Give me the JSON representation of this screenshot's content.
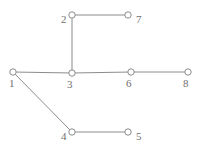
{
  "figure": {
    "name": "undirected-graph-diagram",
    "width": 202,
    "height": 151,
    "background_color": "#ffffff",
    "edge_color": "#8c8c8c",
    "node_stroke_color": "#8c8c8c",
    "node_fill_color": "#ffffff",
    "label_color": "#6e6e6e",
    "node_radius": 3.2,
    "edge_width": 1
  },
  "chart_data": {
    "type": "graph",
    "title": "",
    "xlabel": "",
    "ylabel": "",
    "directed": false,
    "node_count": 8,
    "edge_count": 7,
    "nodes": [
      {
        "id": "1",
        "label": "1",
        "x": 13,
        "y": 72,
        "label_x": 9,
        "label_y": 78,
        "label_anchor": "below-left"
      },
      {
        "id": "2",
        "label": "2",
        "x": 72,
        "y": 15,
        "label_x": 61,
        "label_y": 14,
        "label_anchor": "left"
      },
      {
        "id": "3",
        "label": "3",
        "x": 72,
        "y": 73,
        "label_x": 67,
        "label_y": 79,
        "label_anchor": "below-left"
      },
      {
        "id": "4",
        "label": "4",
        "x": 72,
        "y": 132,
        "label_x": 61,
        "label_y": 131,
        "label_anchor": "left"
      },
      {
        "id": "5",
        "label": "5",
        "x": 128,
        "y": 132,
        "label_x": 136,
        "label_y": 131,
        "label_anchor": "right"
      },
      {
        "id": "6",
        "label": "6",
        "x": 131,
        "y": 72,
        "label_x": 126,
        "label_y": 78,
        "label_anchor": "below-left"
      },
      {
        "id": "7",
        "label": "7",
        "x": 128,
        "y": 15,
        "label_x": 136,
        "label_y": 14,
        "label_anchor": "right"
      },
      {
        "id": "8",
        "label": "8",
        "x": 188,
        "y": 72,
        "label_x": 183,
        "label_y": 78,
        "label_anchor": "below-left"
      }
    ],
    "edges": [
      {
        "id": "edge-1-3",
        "source": "1",
        "target": "3"
      },
      {
        "id": "edge-3-6",
        "source": "3",
        "target": "6"
      },
      {
        "id": "edge-6-8",
        "source": "6",
        "target": "8"
      },
      {
        "id": "edge-2-3",
        "source": "2",
        "target": "3"
      },
      {
        "id": "edge-2-7",
        "source": "2",
        "target": "7"
      },
      {
        "id": "edge-1-4",
        "source": "1",
        "target": "4"
      },
      {
        "id": "edge-4-5",
        "source": "4",
        "target": "5"
      }
    ]
  }
}
